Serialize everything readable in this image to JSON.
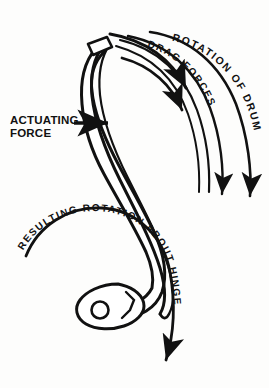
{
  "figure": {
    "background_color": "#fdfdfc",
    "ink_color": "#111111"
  },
  "labels": {
    "actuating_force_line1": "ACTUATING",
    "actuating_force_line2": "FORCE",
    "rotation_of_drum": "ROTATION OF DRUM",
    "drag_forces": "DRAG FORCES",
    "resulting_rotation": "RESULTING ROTATION ABOUT HINGE"
  },
  "diagram_data": {
    "type": "technical-line-drawing",
    "components": [
      {
        "name": "brake-shoe-body",
        "description": "Curved arc-shaped shoe spanning from upper area down to lower-left hinge"
      },
      {
        "name": "brake-lining",
        "description": "Thin outer strip following the shoe's outer curve"
      },
      {
        "name": "hinge-pivot",
        "description": "Rounded boss with circular bore at lower-left end of shoe"
      },
      {
        "name": "actuator-tab",
        "description": "Small rectangular tab at the top end of the shoe"
      }
    ],
    "force_arrows": [
      {
        "name": "actuating-force-arrow",
        "direction": "right",
        "style": "straight",
        "label": "ACTUATING FORCE"
      },
      {
        "name": "drag-force-arrow",
        "direction": "clockwise-down",
        "style": "curved",
        "label": "DRAG FORCES"
      },
      {
        "name": "drum-rotation-arrow-outer",
        "direction": "down",
        "style": "curved",
        "label": "ROTATION OF DRUM"
      },
      {
        "name": "drum-rotation-arrow-inner",
        "direction": "down",
        "style": "curved",
        "label": ""
      },
      {
        "name": "hinge-rotation-arrow",
        "direction": "down-left",
        "style": "curved",
        "label": "RESULTING ROTATION ABOUT HINGE"
      }
    ],
    "arc_guides": [
      {
        "name": "drum-arc-outer"
      },
      {
        "name": "drum-arc-middle"
      },
      {
        "name": "drum-arc-inner"
      },
      {
        "name": "resulting-rotation-arc"
      }
    ]
  }
}
